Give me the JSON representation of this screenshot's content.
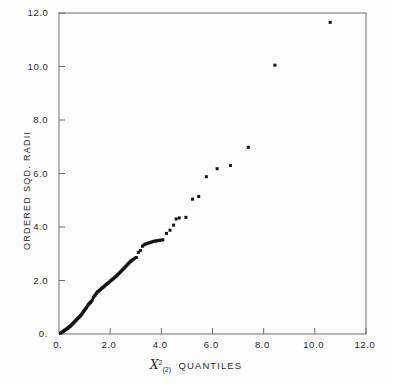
{
  "chart_data": {
    "type": "scatter",
    "title": "",
    "subtitle": "",
    "xlabel": "QUANTILES",
    "xlabel_symbol": "X",
    "xlabel_superscript": "2",
    "xlabel_subscript": "(2)",
    "xlabel_full": "X2(2) QUANTILES",
    "ylabel": "ORDERED SQD. RADII",
    "xlim": [
      0,
      12
    ],
    "ylim": [
      0,
      12
    ],
    "xticks": [
      0,
      2,
      4,
      6,
      8,
      10,
      12
    ],
    "yticks": [
      0,
      2,
      4,
      6,
      8,
      10,
      12
    ],
    "xtick_labels": [
      "0.",
      "2.0",
      "4.0",
      "6.0",
      "8.0",
      "10.0",
      "12.0"
    ],
    "ytick_labels": [
      "0.",
      "2.0",
      "4.0",
      "6.0",
      "8.0",
      "10.0",
      "12.0"
    ],
    "grid": false,
    "legend": "none",
    "marker": "filled-square",
    "marker_color": "#141414",
    "axis_color": "#6e6e6e",
    "background_color": "#fdfdfd",
    "series": [
      {
        "name": "ordered squared radii vs chi-square (2 df) quantiles",
        "points": [
          [
            0.06,
            0.03
          ],
          [
            0.09,
            0.05
          ],
          [
            0.12,
            0.07
          ],
          [
            0.15,
            0.09
          ],
          [
            0.18,
            0.11
          ],
          [
            0.21,
            0.13
          ],
          [
            0.24,
            0.15
          ],
          [
            0.27,
            0.17
          ],
          [
            0.3,
            0.19
          ],
          [
            0.33,
            0.21
          ],
          [
            0.36,
            0.23
          ],
          [
            0.39,
            0.26
          ],
          [
            0.42,
            0.28
          ],
          [
            0.45,
            0.3
          ],
          [
            0.48,
            0.33
          ],
          [
            0.51,
            0.36
          ],
          [
            0.54,
            0.39
          ],
          [
            0.57,
            0.42
          ],
          [
            0.6,
            0.45
          ],
          [
            0.63,
            0.48
          ],
          [
            0.66,
            0.51
          ],
          [
            0.69,
            0.54
          ],
          [
            0.72,
            0.57
          ],
          [
            0.75,
            0.6
          ],
          [
            0.78,
            0.63
          ],
          [
            0.81,
            0.66
          ],
          [
            0.84,
            0.69
          ],
          [
            0.87,
            0.72
          ],
          [
            0.9,
            0.76
          ],
          [
            0.93,
            0.8
          ],
          [
            0.96,
            0.84
          ],
          [
            0.99,
            0.88
          ],
          [
            1.02,
            0.92
          ],
          [
            1.05,
            0.96
          ],
          [
            1.08,
            1.0
          ],
          [
            1.11,
            1.05
          ],
          [
            1.14,
            1.09
          ],
          [
            1.17,
            1.12
          ],
          [
            1.2,
            1.15
          ],
          [
            1.23,
            1.18
          ],
          [
            1.26,
            1.22
          ],
          [
            1.3,
            1.27
          ],
          [
            1.34,
            1.36
          ],
          [
            1.38,
            1.42
          ],
          [
            1.42,
            1.46
          ],
          [
            1.46,
            1.52
          ],
          [
            1.5,
            1.57
          ],
          [
            1.54,
            1.6
          ],
          [
            1.58,
            1.63
          ],
          [
            1.62,
            1.66
          ],
          [
            1.66,
            1.7
          ],
          [
            1.7,
            1.73
          ],
          [
            1.74,
            1.76
          ],
          [
            1.78,
            1.79
          ],
          [
            1.82,
            1.83
          ],
          [
            1.86,
            1.86
          ],
          [
            1.9,
            1.89
          ],
          [
            1.94,
            1.92
          ],
          [
            1.98,
            1.95
          ],
          [
            2.02,
            1.99
          ],
          [
            2.06,
            2.02
          ],
          [
            2.1,
            2.05
          ],
          [
            2.14,
            2.08
          ],
          [
            2.18,
            2.12
          ],
          [
            2.22,
            2.15
          ],
          [
            2.26,
            2.18
          ],
          [
            2.3,
            2.22
          ],
          [
            2.34,
            2.26
          ],
          [
            2.38,
            2.3
          ],
          [
            2.42,
            2.34
          ],
          [
            2.46,
            2.38
          ],
          [
            2.5,
            2.42
          ],
          [
            2.54,
            2.46
          ],
          [
            2.58,
            2.5
          ],
          [
            2.62,
            2.54
          ],
          [
            2.66,
            2.58
          ],
          [
            2.7,
            2.62
          ],
          [
            2.74,
            2.66
          ],
          [
            2.78,
            2.7
          ],
          [
            2.82,
            2.73
          ],
          [
            2.86,
            2.76
          ],
          [
            2.9,
            2.79
          ],
          [
            2.96,
            2.83
          ],
          [
            3.02,
            2.86
          ],
          [
            3.1,
            3.05
          ],
          [
            3.18,
            3.12
          ],
          [
            3.26,
            3.28
          ],
          [
            3.32,
            3.33
          ],
          [
            3.38,
            3.36
          ],
          [
            3.44,
            3.38
          ],
          [
            3.5,
            3.4
          ],
          [
            3.56,
            3.42
          ],
          [
            3.62,
            3.44
          ],
          [
            3.68,
            3.46
          ],
          [
            3.74,
            3.47
          ],
          [
            3.8,
            3.48
          ],
          [
            3.86,
            3.49
          ],
          [
            3.92,
            3.5
          ],
          [
            3.98,
            3.51
          ],
          [
            4.06,
            3.52
          ],
          [
            4.2,
            3.76
          ],
          [
            4.34,
            3.88
          ],
          [
            4.48,
            4.07
          ],
          [
            4.58,
            4.3
          ],
          [
            4.7,
            4.34
          ],
          [
            4.96,
            4.36
          ],
          [
            5.22,
            5.04
          ],
          [
            5.46,
            5.14
          ],
          [
            5.76,
            5.88
          ],
          [
            6.18,
            6.18
          ],
          [
            6.7,
            6.3
          ],
          [
            7.4,
            6.98
          ],
          [
            8.44,
            10.05
          ],
          [
            10.6,
            11.65
          ]
        ]
      }
    ]
  },
  "axes": {
    "x_axis_name": "chi-square-quantiles-axis",
    "y_axis_name": "ordered-squared-radii-axis"
  }
}
